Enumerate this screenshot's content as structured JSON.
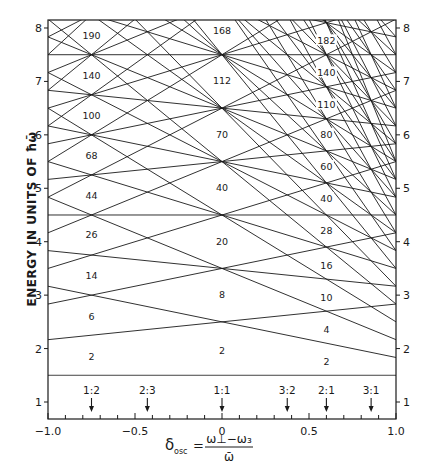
{
  "figure": {
    "type": "oscillator-level-diagram",
    "ylabel": "ENERGY IN UNITS OF ħω̄",
    "xlabel": {
      "lhs": "δ",
      "lhs_sub": "osc",
      "equals": "=",
      "numerator": "ω⊥−ω₃",
      "denominator": "ω̄"
    },
    "x_range": [
      -1.0,
      1.0
    ],
    "y_range_visible": [
      0.68,
      8.15
    ],
    "x_ticks": [
      {
        "value": -1.0,
        "label": "−1.0"
      },
      {
        "value": -0.5,
        "label": "−0.5"
      },
      {
        "value": 0.0,
        "label": "0"
      },
      {
        "value": 0.5,
        "label": "0.5"
      },
      {
        "value": 1.0,
        "label": "1.0"
      }
    ],
    "x_minor_step": 0.1,
    "y_ticks": [
      {
        "value": 1,
        "label": "1"
      },
      {
        "value": 2,
        "label": "2"
      },
      {
        "value": 3,
        "label": "3"
      },
      {
        "value": 4,
        "label": "4"
      },
      {
        "value": 5,
        "label": "5"
      },
      {
        "value": 6,
        "label": "6"
      },
      {
        "value": 7,
        "label": "7"
      },
      {
        "value": 8,
        "label": "8"
      }
    ],
    "shells_N_max": 8,
    "formula": "E = (N + 3/2) + δ[(n⊥+1)/3 − 2(n₃+½)/3], N = n⊥ + n₃",
    "line_color": "#1a1a1a",
    "ratio_arrows": [
      {
        "label": "1:2",
        "delta": -0.75
      },
      {
        "label": "2:3",
        "delta": -0.429
      },
      {
        "label": "1:1",
        "delta": 0.0
      },
      {
        "label": "3:2",
        "delta": 0.375
      },
      {
        "label": "2:1",
        "delta": 0.6
      },
      {
        "label": "3:1",
        "delta": 0.857
      }
    ],
    "magic_numbers": {
      "left_column": {
        "delta": -0.75,
        "values": [
          {
            "label": "2",
            "E": 1.85
          },
          {
            "label": "6",
            "E": 2.6
          },
          {
            "label": "14",
            "E": 3.35
          },
          {
            "label": "26",
            "E": 4.13
          },
          {
            "label": "44",
            "E": 4.85
          },
          {
            "label": "68",
            "E": 5.6
          },
          {
            "label": "100",
            "E": 6.35
          },
          {
            "label": "140",
            "E": 7.1
          },
          {
            "label": "190",
            "E": 7.85
          }
        ]
      },
      "center_column": {
        "delta": 0.0,
        "values": [
          {
            "label": "2",
            "E": 1.95
          },
          {
            "label": "8",
            "E": 3.0
          },
          {
            "label": "20",
            "E": 4.0
          },
          {
            "label": "40",
            "E": 5.0
          },
          {
            "label": "70",
            "E": 6.0
          },
          {
            "label": "112",
            "E": 7.0
          },
          {
            "label": "168",
            "E": 7.95
          }
        ]
      },
      "right_column": {
        "delta": 0.6,
        "values": [
          {
            "label": "2",
            "E": 1.75
          },
          {
            "label": "4",
            "E": 2.35
          },
          {
            "label": "10",
            "E": 2.95
          },
          {
            "label": "16",
            "E": 3.55
          },
          {
            "label": "28",
            "E": 4.2
          },
          {
            "label": "40",
            "E": 4.8
          },
          {
            "label": "60",
            "E": 5.4
          },
          {
            "label": "80",
            "E": 6.0
          },
          {
            "label": "110",
            "E": 6.55
          },
          {
            "label": "140",
            "E": 7.15
          },
          {
            "label": "182",
            "E": 7.75
          }
        ]
      }
    }
  },
  "chart_data": {
    "type": "line",
    "title": "",
    "xlabel": "δosc = (ω⊥ − ω₃)/ω̄",
    "ylabel": "ENERGY IN UNITS OF ħω̄",
    "xlim": [
      -1.0,
      1.0
    ],
    "ylim": [
      0.68,
      8.15
    ],
    "grid": false,
    "series_rule": {
      "N": [
        0,
        1,
        2,
        3,
        4,
        5,
        6,
        7,
        8,
        9,
        10,
        11,
        12
      ],
      "n3": "0..N"
    },
    "sample_series": [
      {
        "name": "N=0",
        "x": [
          -1,
          1
        ],
        "y": [
          1.5,
          1.5
        ]
      },
      {
        "name": "N=1,n3=0",
        "x": [
          -1,
          1
        ],
        "y": [
          2.167,
          2.833
        ]
      },
      {
        "name": "N=1,n3=1",
        "x": [
          -1,
          1
        ],
        "y": [
          3.167,
          1.833
        ]
      },
      {
        "name": "N=2,n3=0",
        "x": [
          -1,
          1
        ],
        "y": [
          2.833,
          4.167
        ]
      },
      {
        "name": "N=2,n3=1",
        "x": [
          -1,
          1
        ],
        "y": [
          3.833,
          3.167
        ]
      },
      {
        "name": "N=2,n3=2",
        "x": [
          -1,
          1
        ],
        "y": [
          4.833,
          2.167
        ]
      }
    ],
    "annotations": [
      "1:2",
      "2:3",
      "1:1",
      "3:2",
      "2:1",
      "3:1"
    ],
    "shell_closures": {
      "delta_-0.75": [
        2,
        6,
        14,
        26,
        44,
        68,
        100,
        140,
        190
      ],
      "delta_0": [
        2,
        8,
        20,
        40,
        70,
        112,
        168
      ],
      "delta_0.6": [
        2,
        4,
        10,
        16,
        28,
        40,
        60,
        80,
        110,
        140,
        182
      ]
    }
  }
}
